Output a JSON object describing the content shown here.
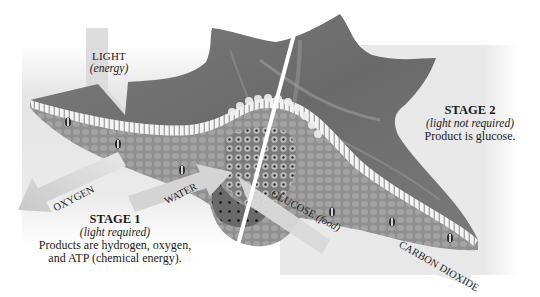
{
  "figure": {
    "palette": {
      "background": "#ffffff",
      "panel": "#e4e4e4",
      "leaf_dark": "#6f6f6f",
      "leaf_mid": "#8a8a8a",
      "cells": "#9a9a9a",
      "epidermis": "#f2f2f2",
      "arrow": "#d9d9d9",
      "divider": "#ffffff",
      "text": "#1a1a1a"
    }
  },
  "labels": {
    "light": {
      "title": "LIGHT",
      "note": "(energy)"
    },
    "oxygen": "OXYGEN",
    "water": "WATER",
    "glucose": {
      "title": "GLUCOSE",
      "note": "(food)"
    },
    "carbon_dioxide": "CARBON DIOXIDE",
    "stage1": {
      "title": "STAGE 1",
      "note": "(light required)",
      "line1": "Products are hydrogen, oxygen,",
      "line2": "and ATP (chemical energy)."
    },
    "stage2": {
      "title": "STAGE 2",
      "note": "(light not required)",
      "line1": "Product is glucose."
    }
  }
}
